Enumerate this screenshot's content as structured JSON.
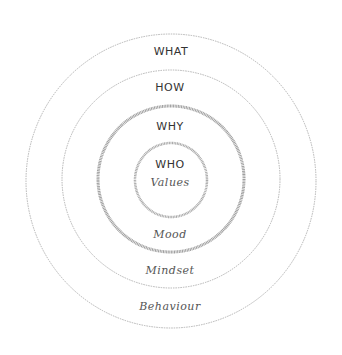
{
  "diagram": {
    "type": "concentric-circles",
    "center": {
      "x": 171,
      "y": 181
    },
    "rings": [
      {
        "id": "outer",
        "top_label": "WHAT",
        "bottom_label": "Behaviour",
        "rx": 145,
        "ry": 147,
        "stroke": "#b0b0b0",
        "stroke_width": 1,
        "dashed": true
      },
      {
        "id": "second",
        "top_label": "HOW",
        "bottom_label": "Mindset",
        "rx": 109,
        "ry": 109,
        "stroke": "#b0b0b0",
        "stroke_width": 1,
        "dashed": true
      },
      {
        "id": "third",
        "top_label": "WHY",
        "bottom_label": "Mood",
        "rx": 73,
        "ry": 73,
        "stroke": "#9a9a9a",
        "stroke_width": 3,
        "dashed": false
      },
      {
        "id": "inner",
        "top_label": "WHO",
        "bottom_label": "Values",
        "rx": 36,
        "ry": 37,
        "stroke": "#a5a5a5",
        "stroke_width": 2.5,
        "dashed": false
      }
    ]
  },
  "labels": {
    "what": "WHAT",
    "how": "HOW",
    "why": "WHY",
    "who": "WHO",
    "values": "Values",
    "mood": "Mood",
    "mindset": "Mindset",
    "behaviour": "Behaviour"
  }
}
